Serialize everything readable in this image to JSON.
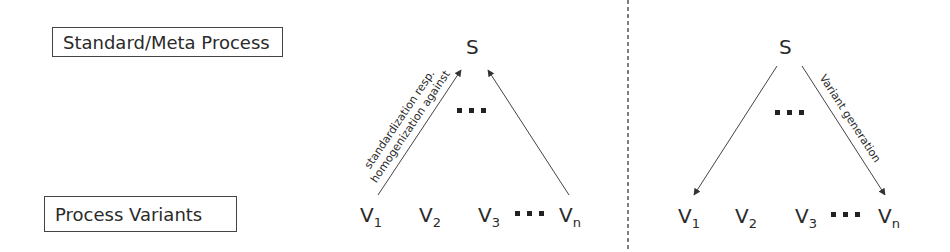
{
  "levels": {
    "top_label": "Standard/Meta Process",
    "bottom_label": "Process Variants"
  },
  "left_diagram": {
    "top_node": "S",
    "ellipsis": "...",
    "variants": [
      {
        "base": "V",
        "sub": "1"
      },
      {
        "base": "V",
        "sub": "2"
      },
      {
        "base": "V",
        "sub": "3"
      },
      {
        "base": "V",
        "sub": "n"
      }
    ],
    "edge_label_line1": "standardization resp.",
    "edge_label_line2": "homogenization against",
    "arrow_direction": "variants-to-standard"
  },
  "right_diagram": {
    "top_node": "S",
    "ellipsis": "...",
    "variants": [
      {
        "base": "V",
        "sub": "1"
      },
      {
        "base": "V",
        "sub": "2"
      },
      {
        "base": "V",
        "sub": "3"
      },
      {
        "base": "V",
        "sub": "n"
      }
    ],
    "edge_label": "Variant generation",
    "arrow_direction": "standard-to-variants"
  },
  "colors": {
    "line": "#444444",
    "text": "#2a2a2a",
    "separator": "#555555"
  }
}
